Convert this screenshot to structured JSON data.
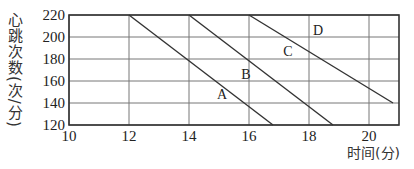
{
  "chart_data": {
    "type": "line",
    "title": "",
    "xlabel": "时间(分)",
    "ylabel": "心跳次数(次/分)",
    "xlim": [
      10,
      21
    ],
    "ylim": [
      120,
      220
    ],
    "x_ticks": [
      10,
      12,
      14,
      16,
      18,
      20
    ],
    "y_ticks": [
      120,
      140,
      160,
      180,
      200,
      220
    ],
    "grid": true,
    "series": [
      {
        "name": "A",
        "x": [
          12,
          16.8
        ],
        "y": [
          220,
          120
        ]
      },
      {
        "name": "B",
        "x": [
          14,
          18.8
        ],
        "y": [
          220,
          120
        ]
      },
      {
        "name": "C",
        "x": [
          16,
          20.8
        ],
        "y": [
          220,
          140
        ]
      }
    ],
    "annotations": [
      {
        "text": "A",
        "x": 15.1,
        "y": 148
      },
      {
        "text": "B",
        "x": 15.9,
        "y": 166
      },
      {
        "text": "C",
        "x": 17.3,
        "y": 187
      },
      {
        "text": "D",
        "x": 18.3,
        "y": 206
      }
    ]
  },
  "labels": {
    "y_axis": "心跳次数(次/分)",
    "x_axis": "时间(分)"
  }
}
